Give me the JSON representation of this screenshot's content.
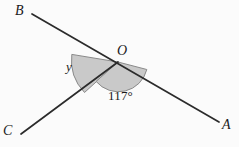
{
  "figure": {
    "type": "geometry-diagram",
    "background_color": "#fbfbfb",
    "line_color": "#2b2b2b",
    "shade_color": "#c9c9c9",
    "shade_stroke_color": "#8f8f8f",
    "vertex": {
      "name": "vertex-O",
      "label": "O",
      "x": 118,
      "y": 62
    },
    "points": [
      {
        "name": "point-B",
        "label": "B",
        "x": 32,
        "y": 14
      },
      {
        "name": "point-C",
        "label": "C",
        "x": 21,
        "y": 134
      },
      {
        "name": "point-A",
        "label": "A",
        "x": 219,
        "y": 122
      }
    ],
    "segments": [
      {
        "name": "line-BA",
        "from": "B",
        "to": "A",
        "through": "O"
      },
      {
        "name": "ray-OC",
        "from": "O",
        "to": "C"
      }
    ],
    "angles": [
      {
        "name": "angle-y",
        "label": "y",
        "value": null,
        "unit": "degrees",
        "between": [
          "OB",
          "OC"
        ],
        "shaded": true,
        "radius": 48
      },
      {
        "name": "angle-117",
        "label": "117°",
        "value": 117,
        "unit": "degrees",
        "between": [
          "OC",
          "OA"
        ],
        "shaded": true,
        "radius": 30
      }
    ]
  }
}
